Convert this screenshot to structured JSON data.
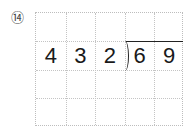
{
  "problem": {
    "number_label": "⑭",
    "divisor": [
      "4",
      "3"
    ],
    "dividend": [
      "2",
      "6",
      "9"
    ],
    "grid": {
      "columns": 5,
      "rows": 4
    }
  }
}
